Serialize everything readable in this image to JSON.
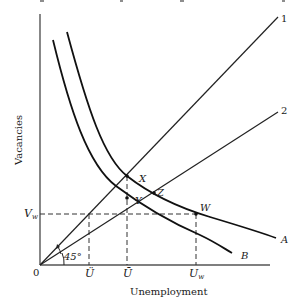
{
  "header_fragment": "... ... ... ... ... ... ... ... ...",
  "diagram": {
    "type": "beveridge_curve_diagram",
    "axes": {
      "x_label": "Unemployment",
      "y_label": "Vacancies",
      "origin_label": "0"
    },
    "x_ticks": [
      {
        "label": "Ü",
        "name": "u-hat",
        "x": 89
      },
      {
        "label": "Ū",
        "name": "u-bar",
        "x": 127
      },
      {
        "label": "U",
        "sub": "w",
        "name": "u-w",
        "x": 196
      }
    ],
    "y_ticks": [
      {
        "label": "V",
        "sub": "w",
        "name": "v-w",
        "y": 214
      }
    ],
    "lines": [
      {
        "id": "1",
        "label": "1",
        "from": [
          40,
          265
        ],
        "to": [
          278,
          17
        ]
      },
      {
        "id": "2",
        "label": "2",
        "from": [
          40,
          265
        ],
        "to": [
          278,
          112
        ]
      }
    ],
    "curves": [
      {
        "id": "A",
        "label": "A"
      },
      {
        "id": "B",
        "label": "B"
      }
    ],
    "points": [
      {
        "label": "X",
        "x": 127,
        "y": 176
      },
      {
        "label": "Y",
        "x": 127,
        "y": 198
      },
      {
        "label": "Z",
        "x": 154,
        "y": 193
      },
      {
        "label": "W",
        "x": 196,
        "y": 214
      }
    ],
    "angle_label": "45°"
  }
}
